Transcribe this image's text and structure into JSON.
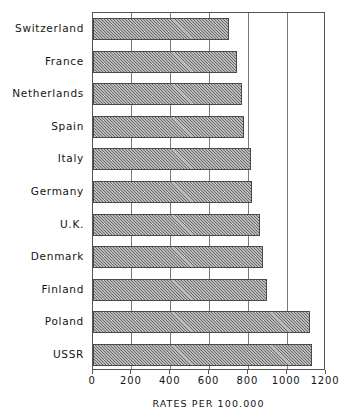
{
  "chart_data": {
    "type": "bar",
    "orientation": "horizontal",
    "title": "",
    "xlabel": "RATES PER 100.000",
    "ylabel": "",
    "xlim": [
      0,
      1200
    ],
    "ylim": null,
    "grid": true,
    "legend": null,
    "xticks": [
      0,
      200,
      400,
      600,
      800,
      1000,
      1200
    ],
    "xtick_labels": [
      "0",
      "200",
      "400",
      "600",
      "800",
      "1000",
      "1200"
    ],
    "categories": [
      "Switzerland",
      "France",
      "Netherlands",
      "Spain",
      "Italy",
      "Germany",
      "U.K.",
      "Denmark",
      "Finland",
      "Poland",
      "USSR"
    ],
    "values": [
      700,
      740,
      765,
      780,
      815,
      820,
      860,
      878,
      895,
      1120,
      1130
    ],
    "series": [
      {
        "name": "Rates per 100.000",
        "values": [
          700,
          740,
          765,
          780,
          815,
          820,
          860,
          878,
          895,
          1120,
          1130
        ]
      }
    ],
    "bar_fill": "#9e9e9e",
    "bar_hatch": "diagonal-45",
    "bar_edge_color": "#4a4a4a",
    "axis_color": "#555555",
    "background": "#ffffff"
  },
  "axis": {
    "caption": "RATES PER 100.000"
  }
}
